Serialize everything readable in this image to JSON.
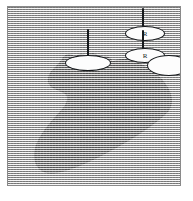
{
  "figure": {
    "kind": "scanned-halftone-plate",
    "caption": "",
    "background_tone": "#c9c9c9",
    "ink_color": "#16191c",
    "frame_color": "#8a8a8a",
    "paper_color": "#ffffff",
    "screen_pattern": "horizontal-line-halftone"
  },
  "plate": {
    "frame_label": "",
    "specimen_label": "",
    "specimen_fill": "#2b2b2b"
  },
  "markers": [
    {
      "id": "left",
      "name": "pin-marker-left",
      "letter": "",
      "has_needle": true,
      "head_fill": "#fdfdfd",
      "head_stroke": "#16191c"
    },
    {
      "id": "upper-right",
      "name": "pin-marker-upper-right",
      "letter": "R",
      "has_needle": true,
      "head_fill": "#fdfdfd",
      "head_stroke": "#16191c"
    },
    {
      "id": "lower-right",
      "name": "pin-marker-lower-right",
      "letter": "R",
      "has_needle": true,
      "head_fill": "#fdfdfd",
      "head_stroke": "#16191c"
    },
    {
      "id": "plain",
      "name": "pin-marker-plain",
      "letter": "",
      "has_needle": false,
      "head_fill": "#fdfdfd",
      "head_stroke": "#16191c"
    }
  ]
}
